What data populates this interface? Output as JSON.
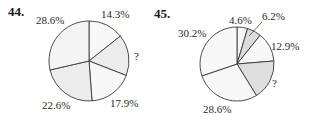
{
  "problems": [
    {
      "number": "44.",
      "unknown_label": "?"
    },
    {
      "number": "45.",
      "unknown_label": "?"
    }
  ],
  "chart_data": [
    {
      "type": "pie",
      "title": "44.",
      "start_angle_deg": 0,
      "direction": "clockwise",
      "slices": [
        {
          "label": "14.3%",
          "value": 14.3,
          "color": "#f7f7f7"
        },
        {
          "label": "?",
          "value": 16.6,
          "color": "#ececec"
        },
        {
          "label": "17.9%",
          "value": 17.9,
          "color": "#f7f7f7"
        },
        {
          "label": "22.6%",
          "value": 22.6,
          "color": "#ececec"
        },
        {
          "label": "28.6%",
          "value": 28.6,
          "color": "#f4f4f4"
        }
      ],
      "center": [
        89,
        61
      ],
      "radius": 40
    },
    {
      "type": "pie",
      "title": "45.",
      "start_angle_deg": 0,
      "direction": "clockwise",
      "slices": [
        {
          "label": "4.6%",
          "value": 4.6,
          "color": "#f7f7f7"
        },
        {
          "label": "6.2%",
          "value": 6.2,
          "color": "#dcdcdc"
        },
        {
          "label": "12.9%",
          "value": 12.9,
          "color": "#f7f7f7"
        },
        {
          "label": "?",
          "value": 17.5,
          "color": "#dedede"
        },
        {
          "label": "28.6%",
          "value": 28.6,
          "color": "#f7f7f7"
        },
        {
          "label": "30.2%",
          "value": 30.2,
          "color": "#f7f7f7"
        }
      ],
      "center": [
        237,
        64
      ],
      "radius": 37
    }
  ],
  "labels": {
    "p44": {
      "a": "28.6%",
      "b": "14.3%",
      "c": "?",
      "d": "17.9%",
      "e": "22.6%"
    },
    "p45": {
      "a": "4.6%",
      "b": "6.2%",
      "c": "12.9%",
      "d": "?",
      "e": "28.6%",
      "f": "30.2%"
    }
  }
}
